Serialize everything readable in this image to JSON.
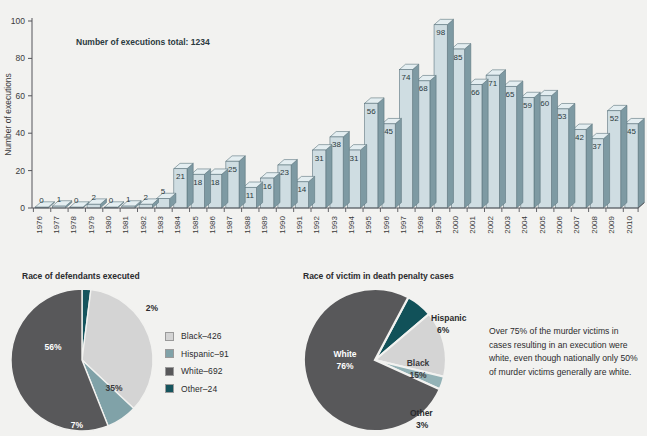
{
  "chart_data": [
    {
      "type": "bar",
      "title": "",
      "note": "Number of executions total: 1234",
      "xlabel": "",
      "ylabel": "Number of executions",
      "ylim": [
        0,
        100
      ],
      "yticks": [
        0,
        20,
        40,
        60,
        80,
        100
      ],
      "grid": false,
      "legend": "none",
      "categories": [
        "1976",
        "1977",
        "1978",
        "1979",
        "1980",
        "1981",
        "1982",
        "1983",
        "1984",
        "1985",
        "1986",
        "1987",
        "1988",
        "1989",
        "1990",
        "1991",
        "1992",
        "1993",
        "1994",
        "1995",
        "1996",
        "1997",
        "1998",
        "1999",
        "2000",
        "2001",
        "2002",
        "2003",
        "2004",
        "2005",
        "2006",
        "2007",
        "2008",
        "2009",
        "2010"
      ],
      "values": [
        0,
        1,
        0,
        2,
        0,
        1,
        2,
        5,
        21,
        18,
        18,
        25,
        11,
        16,
        23,
        14,
        31,
        38,
        31,
        56,
        45,
        74,
        68,
        98,
        85,
        66,
        71,
        65,
        59,
        60,
        53,
        42,
        37,
        52,
        45
      ],
      "colors": {
        "front": "#cfdde2",
        "side": "#7e9aa3",
        "top": "#e4eef1",
        "edge": "#5d757e"
      }
    },
    {
      "type": "pie",
      "title": "Race of defendants executed",
      "labels": [
        "Black",
        "Hispanic",
        "White",
        "Other"
      ],
      "values": [
        35,
        7,
        56,
        2
      ],
      "slice_labels": [
        "35%",
        "7%",
        "56%",
        "2%"
      ],
      "legend": "right",
      "legend_entries": [
        "Black–426",
        "Hispanic–91",
        "White–692",
        "Other–24"
      ],
      "colors": [
        "#d4d4d4",
        "#80a2a8",
        "#58585a",
        "#15545d"
      ]
    },
    {
      "type": "pie",
      "title": "Race of victim in death penalty cases",
      "labels": [
        "White",
        "Hispanic",
        "Black",
        "Other"
      ],
      "values": [
        76,
        6,
        15,
        3
      ],
      "slice_labels": [
        "76%",
        "6%",
        "15%",
        "3%"
      ],
      "legend": "callout",
      "callouts": [
        {
          "name": "White",
          "pct": "76%"
        },
        {
          "name": "Hispanic",
          "pct": "6%"
        },
        {
          "name": "Black",
          "pct": "15%"
        },
        {
          "name": "Other",
          "pct": "3%"
        }
      ],
      "colors": [
        "#58585a",
        "#115159",
        "#d4d4d4",
        "#93b2b6"
      ],
      "annotation": "Over 75% of the murder victims in cases resulting in an execution were white, even though nationally only 50% of murder victims generally are white."
    }
  ],
  "bar_chart": {
    "ylabel": "Number of executions",
    "note": "Number of executions total: 1234",
    "yticks": [
      "0",
      "20",
      "40",
      "60",
      "80",
      "100"
    ]
  },
  "pie_left": {
    "title": "Race of defendants executed",
    "legend": [
      {
        "label": "Black–426",
        "color": "#d4d4d4"
      },
      {
        "label": "Hispanic–91",
        "color": "#80a2a8"
      },
      {
        "label": "White–692",
        "color": "#58585a"
      },
      {
        "label": "Other–24",
        "color": "#15545d"
      }
    ],
    "labels": {
      "white": "56%",
      "black": "35%",
      "hispanic": "7%",
      "other": "2%"
    }
  },
  "pie_right": {
    "title": "Race of victim in death penalty cases",
    "labels": {
      "white_name": "White",
      "white_pct": "76%",
      "black_name": "Black",
      "black_pct": "15%",
      "hispanic_name": "Hispanic",
      "hispanic_pct": "6%",
      "other_name": "Other",
      "other_pct": "3%"
    },
    "annotation": "Over 75% of the murder victims in cases resulting in an execution were white, even though nationally only 50% of murder victims generally are white."
  }
}
